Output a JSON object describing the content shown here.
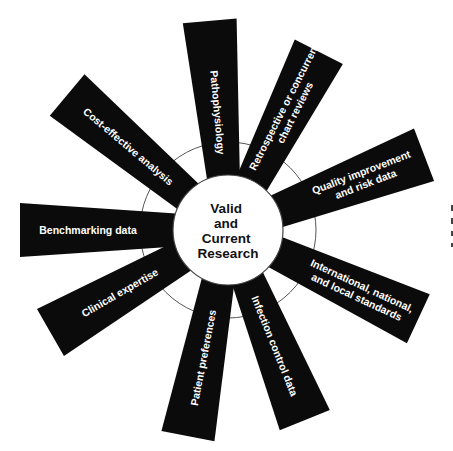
{
  "diagram": {
    "center_label": [
      "Valid",
      "and",
      "Current",
      "Research"
    ],
    "center": {
      "x": 228,
      "y": 230
    },
    "hub_radius": 55,
    "ring_radius": 88,
    "colors": {
      "spoke": "#0b0b0b",
      "spoke_text": "#ffffff",
      "center_text": "#111111",
      "ring": "#555555"
    },
    "spokes": [
      {
        "id": "pathophysiology",
        "lines": [
          "Pathophysiology"
        ],
        "angle": -95,
        "length": 210,
        "inner_w": 26,
        "outer_w": 54,
        "text_pos": 118
      },
      {
        "id": "retrospective",
        "lines": [
          "Retrospective or concurrent",
          "chart reviews"
        ],
        "angle": -63,
        "length": 200,
        "inner_w": 26,
        "outer_w": 54,
        "text_pos": 135
      },
      {
        "id": "quality",
        "lines": [
          "Quality improvement",
          "and risk data"
        ],
        "angle": -21,
        "length": 210,
        "inner_w": 26,
        "outer_w": 56,
        "text_pos": 145
      },
      {
        "id": "international",
        "lines": [
          "International, national,",
          "and local standards"
        ],
        "angle": 25,
        "length": 210,
        "inner_w": 26,
        "outer_w": 54,
        "text_pos": 145
      },
      {
        "id": "infection",
        "lines": [
          "Infection control data"
        ],
        "angle": 68,
        "length": 205,
        "inner_w": 26,
        "outer_w": 54,
        "text_pos": 125
      },
      {
        "id": "patient",
        "lines": [
          "Patient preferences"
        ],
        "angle": 101,
        "length": 210,
        "inner_w": 26,
        "outer_w": 54,
        "text_pos": 130
      },
      {
        "id": "clinical",
        "lines": [
          "Clinical expertise"
        ],
        "angle": 150,
        "length": 205,
        "inner_w": 26,
        "outer_w": 54,
        "text_pos": 125
      },
      {
        "id": "benchmarking",
        "lines": [
          "Benchmarking data"
        ],
        "angle": 180,
        "length": 208,
        "inner_w": 26,
        "outer_w": 54,
        "text_pos": 140
      },
      {
        "id": "cost-effective",
        "lines": [
          "Cost-effective analysis"
        ],
        "angle": -140,
        "length": 210,
        "inner_w": 26,
        "outer_w": 54,
        "text_pos": 130
      }
    ]
  }
}
